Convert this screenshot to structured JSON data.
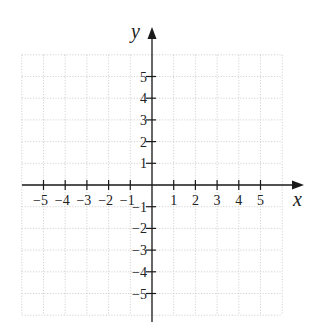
{
  "chart_data": {
    "type": "scatter",
    "title": "",
    "xlabel": "x",
    "ylabel": "y",
    "xlim": [
      -6,
      6
    ],
    "ylim": [
      -6,
      6
    ],
    "grid": true,
    "grid_style": "dotted",
    "x_ticks": [
      -5,
      -4,
      -3,
      -2,
      -1,
      1,
      2,
      3,
      4,
      5
    ],
    "y_ticks": [
      -5,
      -4,
      -3,
      -2,
      -1,
      1,
      2,
      3,
      4,
      5
    ],
    "x_tick_labels": [
      "−5",
      "−4",
      "−3",
      "−2",
      "−1",
      "1",
      "2",
      "3",
      "4",
      "5"
    ],
    "y_tick_labels": [
      "−5",
      "−4",
      "−3",
      "−2",
      "−1",
      "1",
      "2",
      "3",
      "4",
      "5"
    ],
    "series": [],
    "legend": null
  },
  "colors": {
    "axis": "#1a1a1a",
    "grid": "#c8c8c8",
    "background": "#ffffff"
  }
}
